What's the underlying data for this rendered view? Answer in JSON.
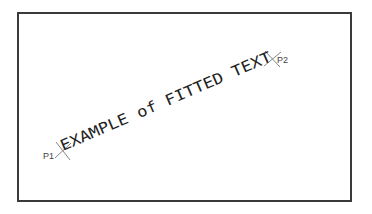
{
  "diagram": {
    "fitted_text": "EXAMPLE of FITTED TEXT",
    "point1_label": "P1",
    "point2_label": "P2",
    "colors": {
      "frame": "#3a3a3a",
      "text": "#222222",
      "cross": "#777777",
      "label": "#444444"
    }
  }
}
